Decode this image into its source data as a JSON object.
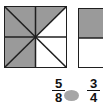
{
  "colors": {
    "shaded": "#9a9a9a",
    "unshaded": "#ffffff",
    "line": "#1f1f1f",
    "oval": "#a6a6a6",
    "text": "#111111"
  },
  "left_figure": {
    "total_parts": 8,
    "shaded_parts": 5
  },
  "right_figure": {
    "total_parts": 4,
    "shaded_parts": 3
  },
  "comparison": {
    "left_fraction": {
      "numerator": "5",
      "denominator": "8"
    },
    "right_fraction": {
      "numerator": "3",
      "denominator": "4"
    }
  }
}
